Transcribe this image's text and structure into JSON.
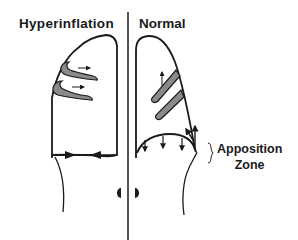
{
  "panels": {
    "left": {
      "title": "Hyperinflation"
    },
    "right": {
      "title": "Normal"
    }
  },
  "annotations": {
    "apposition_line1": "Apposition",
    "apposition_line2": "Zone"
  },
  "colors": {
    "stroke": "#1a1a1a",
    "muscle_fill": "#8a8a8a",
    "background": "#ffffff"
  }
}
